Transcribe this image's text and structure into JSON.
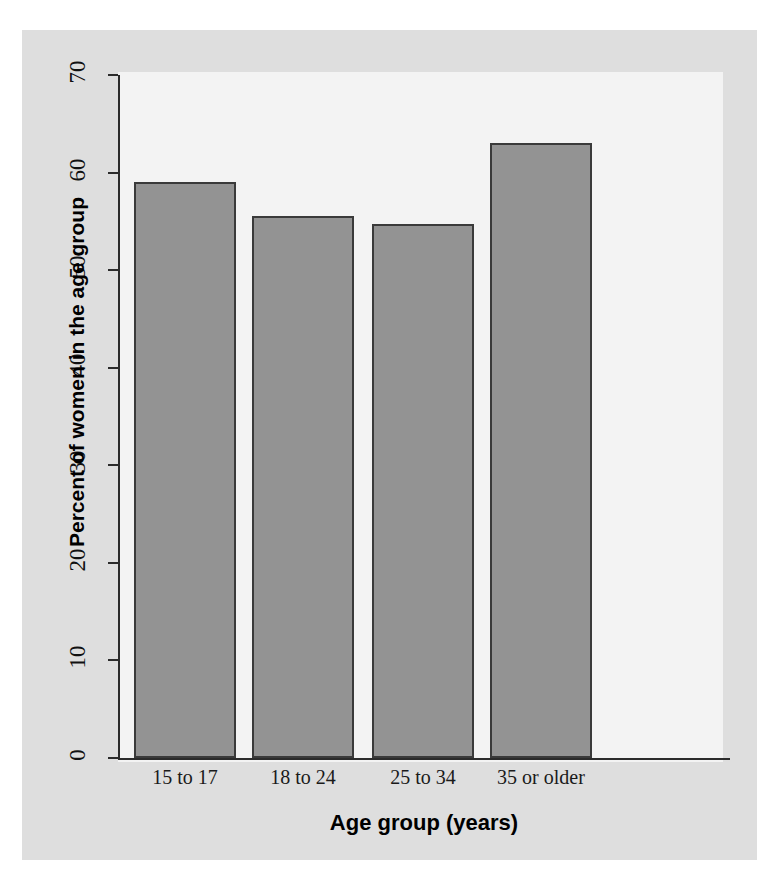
{
  "chart_data": {
    "type": "bar",
    "title": "",
    "xlabel": "Age group (years)",
    "ylabel": "Percent of women in the age group",
    "categories": [
      "15 to 17",
      "18 to 24",
      "25 to 34",
      "35 or older"
    ],
    "values": [
      59.0,
      55.5,
      54.7,
      63.0
    ],
    "ylim": [
      0,
      70
    ],
    "yticks": [
      0,
      10,
      20,
      30,
      40,
      50,
      60,
      70
    ],
    "ytick_labels": [
      "0",
      "10",
      "20",
      "30",
      "40",
      "50",
      "60",
      "70"
    ],
    "grid": false,
    "legend": false,
    "legend_position": "none",
    "colors": {
      "bar_fill": "#939393",
      "bar_edge": "#3a3a3a",
      "plot_background": "#f3f3f3",
      "figure_background": "#dedede",
      "axis": "#2b2b2b",
      "text": "#111111"
    }
  }
}
